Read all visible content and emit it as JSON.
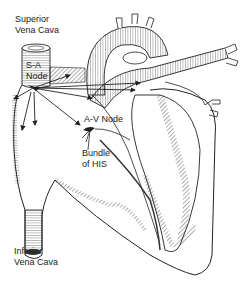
{
  "diagram": {
    "type": "anatomical-line-drawing",
    "labels": {
      "superior_vena_cava_1": "Superior",
      "superior_vena_cava_2": "Vena Cava",
      "sa_node_1": "S-A",
      "sa_node_2": "Node",
      "av_node": "A-V Node",
      "bundle_1": "Bundle",
      "bundle_2": "of HIS",
      "inferior_vena_cava_1": "Inferior",
      "inferior_vena_cava_2": "Vena Cava"
    },
    "colors": {
      "line": "#222222",
      "background": "#ffffff"
    }
  }
}
